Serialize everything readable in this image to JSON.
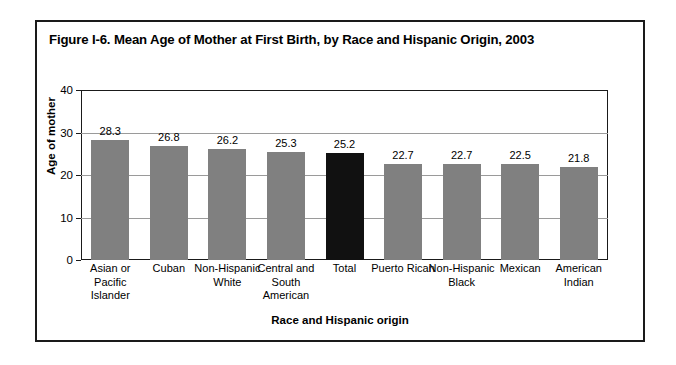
{
  "figure": {
    "title": "Figure I-6. Mean Age of Mother at First Birth, by Race and Hispanic Origin, 2003"
  },
  "chart_data": {
    "type": "bar",
    "title": "Figure I-6. Mean Age of Mother at First Birth, by Race and Hispanic Origin, 2003",
    "xlabel": "Race and Hispanic origin",
    "ylabel": "Age of mother",
    "ylim": [
      0,
      40
    ],
    "yticks": [
      0,
      10,
      20,
      30,
      40
    ],
    "ytick_labels": [
      "0",
      "10",
      "20",
      "30",
      "40"
    ],
    "grid": true,
    "legend": false,
    "categories": [
      "Asian or Pacific Islander",
      "Cuban",
      "Non-Hispanic White",
      "Central and South American",
      "Total",
      "Puerto Rican",
      "Non-Hispanic Black",
      "Mexican",
      "American Indian"
    ],
    "category_lines": [
      [
        "Asian or Pacific",
        "Islander"
      ],
      [
        "Cuban"
      ],
      [
        "Non-Hispanic",
        "White"
      ],
      [
        "Central and",
        "South American"
      ],
      [
        "Total"
      ],
      [
        "Puerto Rican"
      ],
      [
        "Non-Hispanic",
        "Black"
      ],
      [
        "Mexican"
      ],
      [
        "American Indian"
      ]
    ],
    "values": [
      28.3,
      26.8,
      26.2,
      25.3,
      25.2,
      22.7,
      22.7,
      22.5,
      21.8
    ],
    "value_labels": [
      "28.3",
      "26.8",
      "26.2",
      "25.3",
      "25.2",
      "22.7",
      "22.7",
      "22.5",
      "21.8"
    ],
    "highlight_index": 4,
    "colors": {
      "bar": "#808080",
      "bar_highlight": "#111111",
      "gridline": "#9a9a9a",
      "axis": "#1a1a1a",
      "background": "#ffffff",
      "text": "#000000"
    }
  }
}
